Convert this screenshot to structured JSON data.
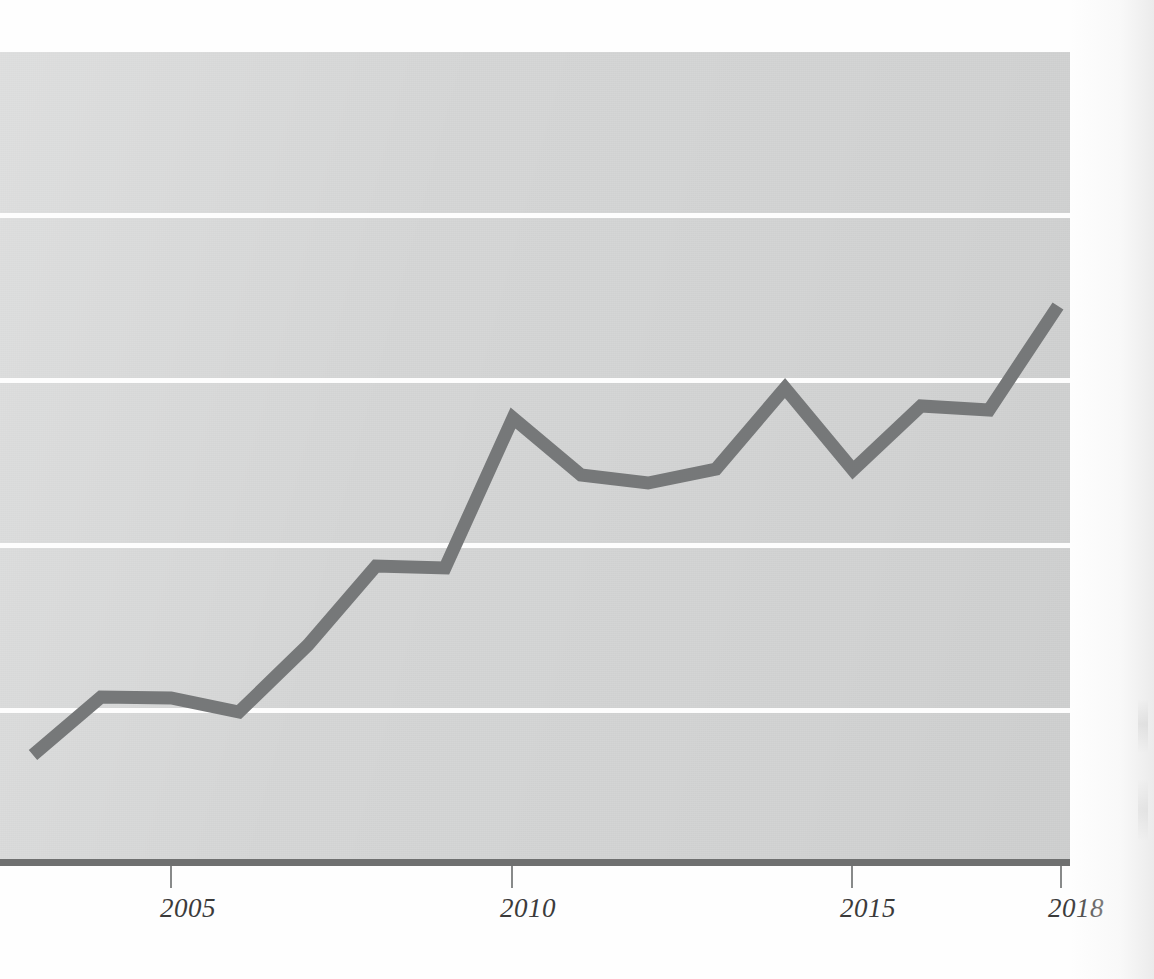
{
  "figure": {
    "background_color": "#fefefe",
    "plot_background_color": "#d3d4d4",
    "gridline_color": "#fdfdfd",
    "axis_color": "#6f7070",
    "series_color": "#767879"
  },
  "axis": {
    "tick_labels": [
      "2005",
      "2010",
      "2015",
      "2018"
    ],
    "tick_values": [
      2005,
      2010,
      2015,
      2018
    ]
  },
  "chart_data": {
    "type": "line",
    "title": "",
    "subtitle": "",
    "xlabel": "",
    "ylabel": "",
    "x": [
      2003,
      2004,
      2005,
      2006,
      2007,
      2008,
      2009,
      2010,
      2011,
      2012,
      2013,
      2014,
      2015,
      2016,
      2017,
      2018
    ],
    "xtick_labels": [
      "2005",
      "2010",
      "2015",
      "2018"
    ],
    "xlim": [
      2003,
      2018
    ],
    "ytick_labels": [],
    "ylim": [
      0,
      1
    ],
    "grid": true,
    "gridlines_horizontal": 4,
    "legend": "none",
    "series": [
      {
        "name": "series-1",
        "color": "#767879",
        "values": [
          0.137,
          0.208,
          0.207,
          0.189,
          0.27,
          0.368,
          0.366,
          0.551,
          0.48,
          0.471,
          0.488,
          0.593,
          0.49,
          0.57,
          0.565,
          0.693
        ]
      }
    ],
    "series_pixel_points": [
      {
        "year": 2003,
        "x": 33,
        "y": 755
      },
      {
        "year": 2004,
        "x": 101,
        "y": 697
      },
      {
        "year": 2005,
        "x": 171,
        "y": 698
      },
      {
        "year": 2006,
        "x": 239,
        "y": 712
      },
      {
        "year": 2007,
        "x": 308,
        "y": 645
      },
      {
        "year": 2008,
        "x": 376,
        "y": 566
      },
      {
        "year": 2009,
        "x": 445,
        "y": 568
      },
      {
        "year": 2010,
        "x": 513,
        "y": 418
      },
      {
        "year": 2011,
        "x": 581,
        "y": 475
      },
      {
        "year": 2012,
        "x": 648,
        "y": 483
      },
      {
        "year": 2013,
        "x": 716,
        "y": 469
      },
      {
        "year": 2014,
        "x": 785,
        "y": 388
      },
      {
        "year": 2015,
        "x": 853,
        "y": 470
      },
      {
        "year": 2016,
        "x": 921,
        "y": 406
      },
      {
        "year": 2017,
        "x": 989,
        "y": 410
      },
      {
        "year": 2018,
        "x": 1058,
        "y": 306
      }
    ],
    "gridline_pixel_y": [
      213,
      378,
      543,
      708
    ]
  }
}
